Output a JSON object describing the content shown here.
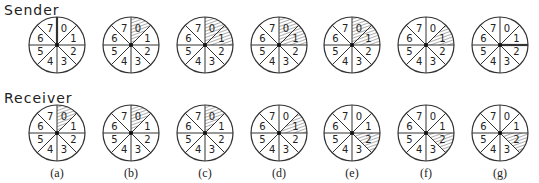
{
  "labels": {
    "sender": "Sender",
    "receiver": "Receiver"
  },
  "sectors": [
    "0",
    "1",
    "2",
    "3",
    "4",
    "5",
    "6",
    "7"
  ],
  "captions": [
    "(a)",
    "(b)",
    "(c)",
    "(d)",
    "(e)",
    "(f)",
    "(g)"
  ],
  "centers_x": [
    57,
    131,
    205,
    279,
    352,
    426,
    500
  ],
  "row_y": {
    "sender": 45,
    "receiver": 133
  },
  "radius": 28,
  "sender": [
    {
      "shaded": [],
      "thick_boundary": 0
    },
    {
      "shaded": [
        0
      ],
      "thick_boundary": null
    },
    {
      "shaded": [
        0,
        1
      ],
      "thick_boundary": null
    },
    {
      "shaded": [
        0,
        1
      ],
      "thick_boundary": null
    },
    {
      "shaded": [
        0,
        1
      ],
      "thick_boundary": null
    },
    {
      "shaded": [
        1
      ],
      "thick_boundary": null
    },
    {
      "shaded": [],
      "thick_boundary": 2
    }
  ],
  "receiver": [
    {
      "shaded": [
        0
      ]
    },
    {
      "shaded": [
        0
      ]
    },
    {
      "shaded": [
        0
      ]
    },
    {
      "shaded": [
        1
      ]
    },
    {
      "shaded": [
        2
      ]
    },
    {
      "shaded": [
        2
      ]
    },
    {
      "shaded": [
        2
      ]
    }
  ]
}
